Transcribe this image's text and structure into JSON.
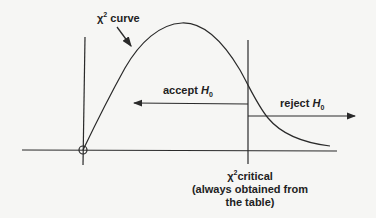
{
  "diagram": {
    "curve_label": {
      "symbol": "χ",
      "superscript": "2",
      "text": " curve"
    },
    "accept_label": {
      "text": "accept ",
      "h": "H",
      "sub": "0"
    },
    "reject_label": {
      "text": "reject ",
      "h": "H",
      "sub": "0"
    },
    "critical_label": {
      "symbol": "χ",
      "superscript": "2",
      "text": "critical",
      "line2": "(always obtained from",
      "line3": "the table)"
    },
    "colors": {
      "line": "#2a2a2a",
      "background": "#f6f6f4"
    }
  }
}
